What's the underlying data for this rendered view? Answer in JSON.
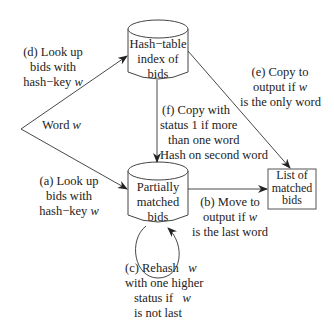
{
  "nodes": {
    "hash_index": {
      "lines": [
        "Hash−table",
        "index of",
        "bids"
      ]
    },
    "partial": {
      "lines": [
        "Partially",
        "matched",
        "bids"
      ]
    },
    "output_list": {
      "lines": [
        "List of",
        "matched",
        "bids"
      ]
    },
    "input": {
      "label": "Word",
      "var": "w"
    }
  },
  "edges": {
    "a": {
      "lines": [
        "(a) Look up",
        "bids with",
        "hash−key"
      ],
      "var": "w"
    },
    "b": {
      "lines": [
        "(b) Move to",
        "output if",
        "is the last word"
      ],
      "var": "w"
    },
    "c": {
      "lines": [
        "(c) Rehash",
        "with one higher",
        "status if",
        "is not last"
      ],
      "var": "w"
    },
    "d": {
      "lines": [
        "(d) Look up",
        "bids with",
        "hash−key"
      ],
      "var": "w"
    },
    "e": {
      "lines": [
        "(e) Copy to",
        "output if",
        "is the only word"
      ],
      "var": "w"
    },
    "f": {
      "lines": [
        "(f) Copy with",
        "status 1 if more",
        "than one word",
        "Hash on second word"
      ]
    }
  },
  "colors": {
    "stroke": "#333333",
    "text": "#222222",
    "background": "#ffffff"
  }
}
